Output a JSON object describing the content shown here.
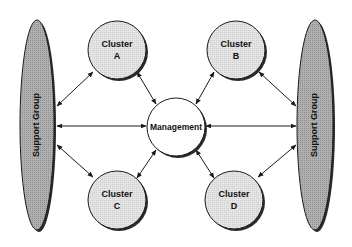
{
  "diagram": {
    "type": "hub-and-spoke organizational diagram",
    "colors": {
      "background": "#ffffff",
      "cluster_fill": "#e2e2e2",
      "support_fill": "#a9a9a9",
      "management_fill": "#ffffff",
      "stroke": "#1a1a1a",
      "shadow": "#2a2a2a"
    },
    "support_groups": [
      {
        "id": "left",
        "label": "Support Group",
        "cx": 37,
        "cy": 125,
        "rx": 17,
        "ry": 105
      },
      {
        "id": "right",
        "label": "Support Group",
        "cx": 315,
        "cy": 125,
        "rx": 18,
        "ry": 105
      }
    ],
    "management": {
      "label": "Management",
      "cx": 176,
      "cy": 127,
      "r": 29
    },
    "clusters": [
      {
        "id": "A",
        "line1": "Cluster",
        "line2": "A",
        "cx": 117,
        "cy": 50,
        "r": 29
      },
      {
        "id": "B",
        "line1": "Cluster",
        "line2": "B",
        "cx": 236,
        "cy": 50,
        "r": 29
      },
      {
        "id": "C",
        "line1": "Cluster",
        "line2": "C",
        "cx": 117,
        "cy": 200,
        "r": 29
      },
      {
        "id": "D",
        "line1": "Cluster",
        "line2": "D",
        "cx": 234,
        "cy": 200,
        "r": 29
      }
    ],
    "connections": [
      {
        "from": "Support Group (left)",
        "to": "Cluster A",
        "bidirectional": true
      },
      {
        "from": "Support Group (left)",
        "to": "Management",
        "bidirectional": true
      },
      {
        "from": "Support Group (left)",
        "to": "Cluster C",
        "bidirectional": true
      },
      {
        "from": "Support Group (right)",
        "to": "Cluster B",
        "bidirectional": true
      },
      {
        "from": "Support Group (right)",
        "to": "Management",
        "bidirectional": true
      },
      {
        "from": "Support Group (right)",
        "to": "Cluster D",
        "bidirectional": true
      },
      {
        "from": "Cluster A",
        "to": "Management",
        "bidirectional": true
      },
      {
        "from": "Cluster B",
        "to": "Management",
        "bidirectional": true
      },
      {
        "from": "Cluster C",
        "to": "Management",
        "bidirectional": true
      },
      {
        "from": "Cluster D",
        "to": "Management",
        "bidirectional": true
      }
    ]
  }
}
